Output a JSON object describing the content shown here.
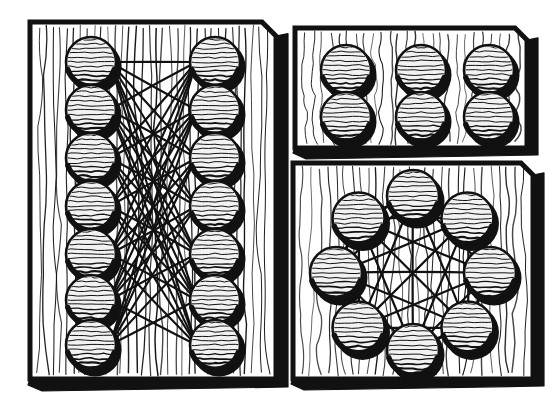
{
  "illustration": {
    "title": "Three Wooden Boards With String-Linked Spheres",
    "style": "woodcut-pen-and-ink",
    "background_color": "#ffffff",
    "ink_color": "#111111",
    "board_fill_color": "#ffffff",
    "sphere_fill_color": "#f2f2f2",
    "width": 558,
    "height": 416
  },
  "panels": [
    {
      "id": "left-panel",
      "name": "bipartite-board",
      "label": "Left board: two columns of seven spheres, densely cross-linked",
      "topology": "bipartite",
      "sphere_count": 14,
      "rows": 7,
      "columns": 2,
      "has_strings": true,
      "board": {
        "x": 30,
        "y": 22,
        "width": 246,
        "height": 357,
        "bevel": 14,
        "shadow_depth": 12,
        "grain_line_count": 34
      },
      "sphere_radius": 25,
      "left_column_x": 91,
      "right_column_x": 215,
      "row_y": [
        62,
        110,
        158,
        206,
        254,
        300,
        345
      ],
      "edges": [
        [
          0,
          0
        ],
        [
          0,
          1
        ],
        [
          0,
          2
        ],
        [
          0,
          3
        ],
        [
          0,
          4
        ],
        [
          0,
          5
        ],
        [
          0,
          6
        ],
        [
          1,
          0
        ],
        [
          1,
          2
        ],
        [
          1,
          3
        ],
        [
          1,
          4
        ],
        [
          1,
          5
        ],
        [
          1,
          6
        ],
        [
          2,
          0
        ],
        [
          2,
          1
        ],
        [
          2,
          3
        ],
        [
          2,
          4
        ],
        [
          2,
          5
        ],
        [
          2,
          6
        ],
        [
          3,
          0
        ],
        [
          3,
          1
        ],
        [
          3,
          2
        ],
        [
          3,
          4
        ],
        [
          3,
          5
        ],
        [
          3,
          6
        ],
        [
          4,
          0
        ],
        [
          4,
          1
        ],
        [
          4,
          2
        ],
        [
          4,
          3
        ],
        [
          4,
          5
        ],
        [
          4,
          6
        ],
        [
          5,
          0
        ],
        [
          5,
          1
        ],
        [
          5,
          2
        ],
        [
          5,
          3
        ],
        [
          5,
          4
        ],
        [
          5,
          6
        ],
        [
          6,
          0
        ],
        [
          6,
          1
        ],
        [
          6,
          2
        ],
        [
          6,
          3
        ],
        [
          6,
          4
        ],
        [
          6,
          5
        ]
      ]
    },
    {
      "id": "top-right-panel",
      "name": "grid-board",
      "label": "Top right board: six unconnected spheres in a two by three grid",
      "topology": "disconnected-grid",
      "sphere_count": 6,
      "rows": 2,
      "columns": 3,
      "has_strings": false,
      "board": {
        "x": 295,
        "y": 28,
        "width": 232,
        "height": 120,
        "bevel": 12,
        "shadow_depth": 11,
        "grain_line_count": 26
      },
      "sphere_radius": 25,
      "column_x": [
        346,
        421,
        489
      ],
      "row_y": [
        70,
        117
      ]
    },
    {
      "id": "bottom-right-panel",
      "name": "complete-graph-board",
      "label": "Bottom right board: eight spheres in a ring, fully interconnected",
      "topology": "complete-graph-k8",
      "sphere_count": 8,
      "has_strings": true,
      "board": {
        "x": 293,
        "y": 163,
        "width": 240,
        "height": 216,
        "bevel": 12,
        "shadow_depth": 11,
        "grain_line_count": 28
      },
      "sphere_radius": 26,
      "ring_center": [
        413,
        273
      ],
      "ring_radius": 77,
      "ring_start_angle_deg": -90,
      "edge_count": 28
    }
  ],
  "legend": {
    "sphere_hatch_lines": 11,
    "sphere_shadow_offset": [
      4,
      5
    ],
    "string_width": 2.1
  }
}
